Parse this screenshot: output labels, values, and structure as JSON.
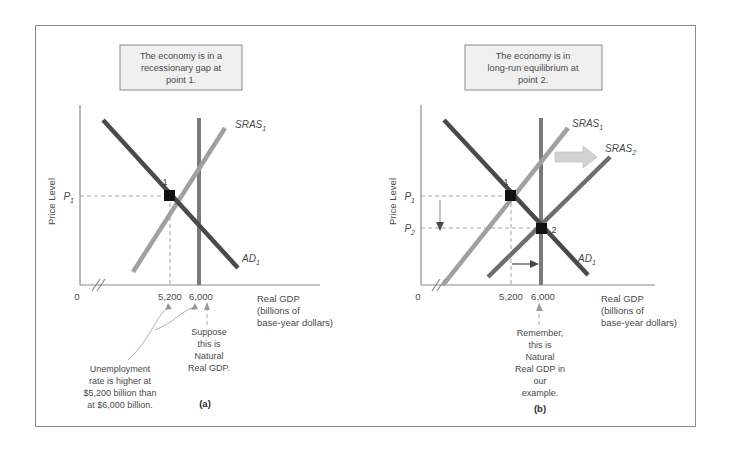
{
  "figure": {
    "panels": [
      {
        "id": "a",
        "caption": "(a)",
        "callout": [
          "The economy is in a",
          "recessionary gap at",
          "point 1."
        ],
        "y_axis_label": "Price Level",
        "x_axis_label": [
          "Real GDP",
          "(billions of",
          "base-year dollars)"
        ],
        "origin_label": "0",
        "price_labels": [
          {
            "base": "P",
            "sub": "1"
          }
        ],
        "x_ticks": [
          "5,200",
          "6,000"
        ],
        "curves": [
          {
            "name": "AD",
            "sub": "1",
            "label": "AD"
          },
          {
            "name": "SRAS",
            "sub": "1",
            "label": "SRAS"
          },
          {
            "name": "LRAS",
            "sub": "",
            "label": ""
          }
        ],
        "equilibrium_points": [
          {
            "label": "1"
          }
        ],
        "notes": [
          {
            "id": "unemployment-note",
            "lines": [
              "Unemployment",
              "rate is higher at",
              "$5,200 billion than",
              "at $6,000 billion."
            ]
          },
          {
            "id": "natural-real-gdp-note",
            "lines": [
              "Suppose",
              "this is",
              "Natural",
              "Real GDP."
            ]
          }
        ]
      },
      {
        "id": "b",
        "caption": "(b)",
        "callout": [
          "The economy is in",
          "long-run equilibrium at",
          "point 2."
        ],
        "y_axis_label": "Price Level",
        "x_axis_label": [
          "Real GDP",
          "(billions of",
          "base-year dollars)"
        ],
        "origin_label": "0",
        "price_labels": [
          {
            "base": "P",
            "sub": "1"
          },
          {
            "base": "P",
            "sub": "2"
          }
        ],
        "x_ticks": [
          "5,200",
          "6,000"
        ],
        "curves": [
          {
            "name": "AD",
            "sub": "1",
            "label": "AD"
          },
          {
            "name": "SRAS",
            "sub": "1",
            "label": "SRAS"
          },
          {
            "name": "SRAS",
            "sub": "2",
            "label": "SRAS"
          },
          {
            "name": "LRAS",
            "sub": "",
            "label": ""
          }
        ],
        "equilibrium_points": [
          {
            "label": "1"
          },
          {
            "label": "2"
          }
        ],
        "notes": [
          {
            "id": "remember-note",
            "lines": [
              "Remember,",
              "this is",
              "Natural",
              "Real GDP in",
              "our",
              "example."
            ]
          }
        ]
      }
    ],
    "colors": {
      "ad_curve": "#4a4a4a",
      "sras1_curve": "#a0a0a0",
      "sras2_curve": "#6e6e6e",
      "lras_curve": "#7a7a7a",
      "axis": "#8a8a8a",
      "callout_fill": "#f0f0f0",
      "callout_border": "#8a8a8a",
      "point_fill": "#111111",
      "shift_arrow": "#d0d0d0"
    }
  }
}
